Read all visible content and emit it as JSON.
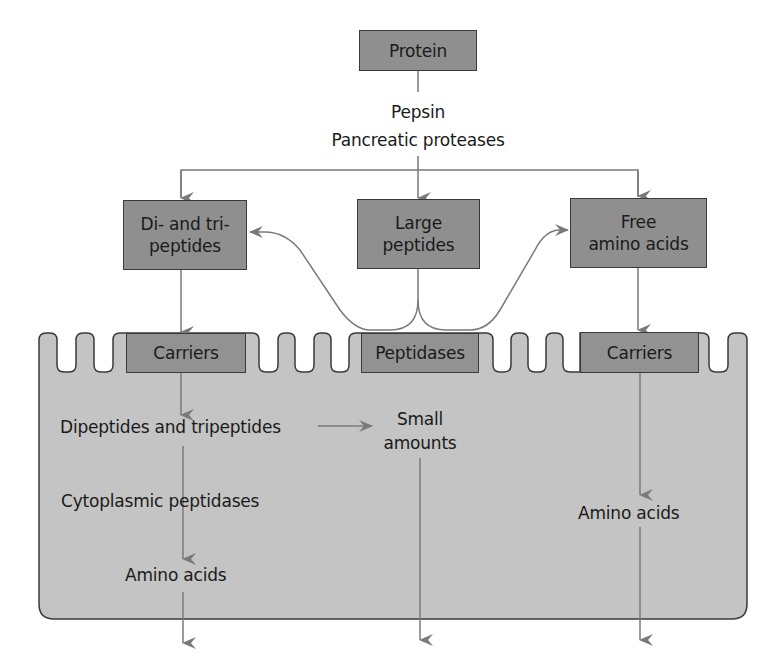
{
  "diagram": {
    "title_node": "Protein",
    "enzymes": {
      "line1": "Pepsin",
      "line2": "Pancreatic proteases"
    },
    "luminal_products": [
      {
        "line1": "Di- and tri-",
        "line2": "peptides"
      },
      {
        "line1": "Large",
        "line2": "peptides"
      },
      {
        "line1": "Free",
        "line2": "amino acids"
      }
    ],
    "brush_border": [
      {
        "label": "Carriers"
      },
      {
        "label": "Peptidases"
      },
      {
        "label": "Carriers"
      }
    ],
    "cell_labels": {
      "dipeptides": "Dipeptides and tripeptides",
      "small_amounts_line1": "Small",
      "small_amounts_line2": "amounts",
      "cytoplasmic": "Cytoplasmic peptidases",
      "amino_acids_left": "Amino acids",
      "amino_acids_right": "Amino acids"
    },
    "colors": {
      "box_fill": "#8f8f8f",
      "cell_fill": "#c4c4c4",
      "arrow": "#7a7a7a",
      "outline": "#3a3a3a"
    }
  }
}
